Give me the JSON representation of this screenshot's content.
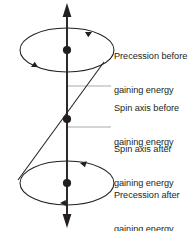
{
  "figure": {
    "type": "physics-diagram",
    "background_color": "#ffffff",
    "stroke_color": "#231f20",
    "leader_color": "#a7a9ac",
    "text_color": "#231f20",
    "vertical_axis": {
      "name": "vertical-reference-axis",
      "x": 67,
      "top_y": 4,
      "bottom_y": 227,
      "arrow_top": true,
      "arrow_bottom": true
    },
    "tilted_axis": {
      "name": "tilted-spin-axis",
      "x1": 18,
      "y1": 180,
      "x2": 104,
      "y2": 62
    },
    "ellipses": [
      {
        "name": "precession-ellipse-top",
        "cx": 67,
        "cy": 50,
        "rx": 47,
        "ry": 22,
        "arrow_positions": [
          "upper-right",
          "lower-left"
        ]
      },
      {
        "name": "precession-ellipse-bottom",
        "cx": 67,
        "cy": 183,
        "rx": 47,
        "ry": 22,
        "arrow_positions": [
          "upper-right",
          "lower-left"
        ]
      }
    ],
    "dots": [
      {
        "name": "dot-top-center",
        "cx": 67,
        "cy": 50,
        "r": 4
      },
      {
        "name": "dot-middle-center",
        "cx": 67,
        "cy": 119,
        "r": 4
      },
      {
        "name": "dot-bottom-center",
        "cx": 67,
        "cy": 183,
        "r": 4
      }
    ],
    "leader_lines": [
      {
        "name": "leader-spin-axis-before",
        "x1": 67,
        "y1": 86,
        "x2": 111,
        "y2": 86
      },
      {
        "name": "leader-spin-axis-after",
        "x1": 67,
        "y1": 127,
        "x2": 111,
        "y2": 127
      }
    ]
  },
  "labels": {
    "precession_before": {
      "line1": "Precession before",
      "line2": "gaining energy"
    },
    "spin_axis_before": {
      "line1": "Spin axis before",
      "line2": "gaining energy"
    },
    "spin_axis_after": {
      "line1": "Spin axis after",
      "line2": "gaining energy"
    },
    "precession_after": {
      "line1": "Precession after",
      "line2": "gaining energy"
    }
  }
}
